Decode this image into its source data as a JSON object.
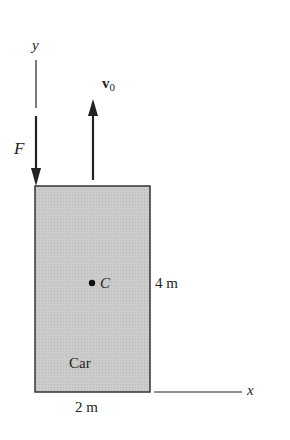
{
  "figure": {
    "axes": {
      "y_label": "y",
      "x_label": "x"
    },
    "force": {
      "label": "F",
      "direction": "down"
    },
    "velocity": {
      "label": "v",
      "subscript": "0",
      "direction": "up"
    },
    "body": {
      "label": "Car",
      "fill": "#c9c9c9",
      "stroke": "#333333"
    },
    "center": {
      "label": "C"
    },
    "dimensions": {
      "height": "4 m",
      "width": "2 m"
    }
  }
}
